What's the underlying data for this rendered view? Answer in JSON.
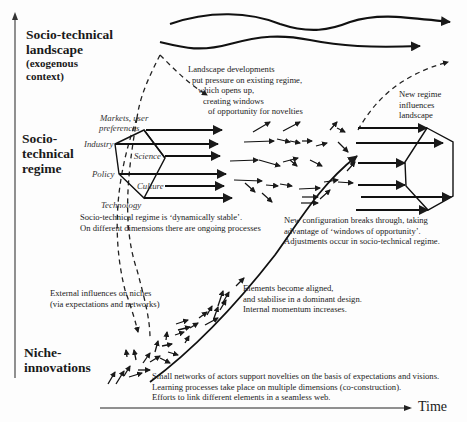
{
  "levels": {
    "landscape": {
      "title_1": "Socio-technical",
      "title_2": "landscape",
      "sub_1": "(exogenous",
      "sub_2": "context)"
    },
    "regime": {
      "line_1": "Socio-",
      "line_2": "technical",
      "line_3": "regime"
    },
    "niche": {
      "line_1": "Niche-",
      "line_2": "innovations"
    }
  },
  "regime_dimensions": {
    "markets_1": "Markets, user",
    "markets_2": "preferences",
    "industry": "Industry",
    "science": "Science",
    "policy": "Policy",
    "culture": "Culture",
    "technology": "Technology"
  },
  "annotations": {
    "landscape_pressure": [
      "Landscape developments",
      "put pressure on existing regime,",
      "which opens up,",
      "creating windows",
      "of opportunity for novelties"
    ],
    "new_regime_influences": [
      "New regime",
      "influences",
      "landscape"
    ],
    "regime_stable": [
      "Socio-technical regime is ‘dynamically stable’.",
      "On different dimensions there are ongoing processes"
    ],
    "breakthrough": [
      "New configuration breaks through, taking",
      "advantage of ‘windows of opportunity’.",
      "Adjustments occur in socio-technical regime."
    ],
    "external_influences": [
      "External influences on niches",
      "(via expectations and networks)"
    ],
    "aligned": [
      "Elements become aligned,",
      "and stabilise in a dominant design.",
      "Internal momentum increases."
    ],
    "small_networks": [
      "Small networks of actors support novelties on the basis of expectations and visions.",
      "Learning processes take place on multiple dimensions (co-construction).",
      "Efforts to link different elements in a seamless web."
    ]
  },
  "axes": {
    "x_label": "Time",
    "y_axis": "vertical-structuration-arrow"
  },
  "colors": {
    "ink": "#1a1a1a",
    "background": "#fdfdfd"
  }
}
